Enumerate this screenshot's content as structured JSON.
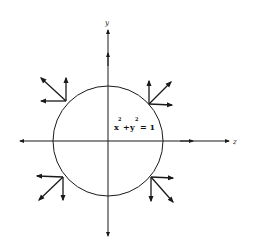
{
  "figure": {
    "type": "diagram",
    "colors": {
      "ink": "#1a1a1a",
      "background": "#ffffff"
    },
    "axes": {
      "x_label": "z",
      "y_label": "y"
    },
    "circle": {
      "equation": {
        "base_x": "x",
        "sup_x": "2",
        "plus": "+",
        "base_y": "y",
        "sup_y": "2",
        "equals": "= 1"
      }
    },
    "vector_triads": [
      {
        "position": "upper-left",
        "arrows": [
          "left",
          "up",
          "up-left"
        ]
      },
      {
        "position": "upper-right",
        "arrows": [
          "right",
          "up",
          "up-right"
        ]
      },
      {
        "position": "lower-left",
        "arrows": [
          "left",
          "down",
          "down-left"
        ]
      },
      {
        "position": "lower-right",
        "arrows": [
          "right",
          "down",
          "down-right"
        ]
      }
    ]
  }
}
